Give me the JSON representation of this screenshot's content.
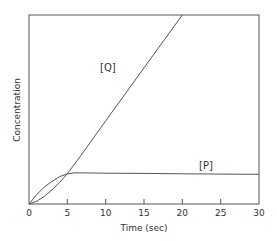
{
  "chart_data": {
    "type": "line",
    "title": "",
    "xlabel": "Time (sec)",
    "ylabel": "Concentration",
    "xlim": [
      0,
      30
    ],
    "ylim": [
      0,
      1
    ],
    "xticks": [
      0,
      5,
      10,
      15,
      20,
      25,
      30
    ],
    "xtick_labels": [
      "0",
      "5",
      "10",
      "15",
      "20",
      "25",
      "30"
    ],
    "yticks": [],
    "grid": false,
    "legend": "inline labels",
    "series": [
      {
        "name": "[Q]",
        "x": [
          0,
          1,
          2,
          3,
          4,
          5,
          7,
          10,
          15,
          20
        ],
        "values": [
          0,
          0.015,
          0.04,
          0.075,
          0.115,
          0.16,
          0.27,
          0.44,
          0.72,
          1.0
        ]
      },
      {
        "name": "[P]",
        "x": [
          0,
          1,
          2,
          3,
          4,
          5,
          6,
          10,
          15,
          20,
          25,
          30
        ],
        "values": [
          0,
          0.05,
          0.09,
          0.12,
          0.145,
          0.16,
          0.165,
          0.163,
          0.162,
          0.16,
          0.158,
          0.157
        ]
      }
    ]
  }
}
